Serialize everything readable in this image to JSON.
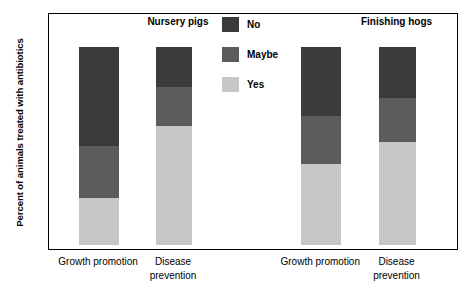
{
  "chart_data": {
    "type": "bar",
    "subtype": "stacked-bar-100",
    "title": "",
    "xlabel": "",
    "ylabel": "Percent of animals treated with antibiotics",
    "ylim": [
      0,
      100
    ],
    "yticks": [
      0,
      20,
      40,
      60,
      80,
      100
    ],
    "ytick_labels": [
      "0",
      "20",
      "40",
      "60",
      "80",
      "100"
    ],
    "grid": false,
    "legend_position": "upper center",
    "legend": [
      {
        "name": "No",
        "color": "#3b3b3b"
      },
      {
        "name": "Maybe",
        "color": "#5c5c5c"
      },
      {
        "name": "Yes",
        "color": "#c6c6c6"
      }
    ],
    "groups": [
      {
        "name": "Nursery pigs",
        "center_pct": 31.7
      },
      {
        "name": "Finishing hogs",
        "center_pct": 85.0
      }
    ],
    "categories": [
      "Growth promotion",
      "Disease\nprevention",
      "Growth promotion",
      "Disease\nprevention"
    ],
    "bars": [
      {
        "group": "Nursery pigs",
        "category": "Growth promotion",
        "x_left_pct": 7.3,
        "width_pct": 9.8,
        "label_center_pct": 12.2,
        "segments": [
          {
            "name": "Yes",
            "value": 23.5,
            "from": 0,
            "to": 23.5,
            "color": "#c6c6c6"
          },
          {
            "name": "Maybe",
            "value": 26.5,
            "from": 23.5,
            "to": 50.0,
            "color": "#5c5c5c"
          },
          {
            "name": "No",
            "value": 50.0,
            "from": 50.0,
            "to": 100.0,
            "color": "#3b3b3b"
          }
        ]
      },
      {
        "group": "Nursery pigs",
        "category": "Disease\nprevention",
        "x_left_pct": 26.1,
        "width_pct": 8.8,
        "label_center_pct": 30.5,
        "segments": [
          {
            "name": "Yes",
            "value": 60.0,
            "from": 0,
            "to": 60.0,
            "color": "#c6c6c6"
          },
          {
            "name": "Maybe",
            "value": 20.0,
            "from": 60.0,
            "to": 80.0,
            "color": "#5c5c5c"
          },
          {
            "name": "No",
            "value": 20.0,
            "from": 80.0,
            "to": 100.0,
            "color": "#3b3b3b"
          }
        ]
      },
      {
        "group": "Finishing hogs",
        "category": "Growth promotion",
        "x_left_pct": 61.5,
        "width_pct": 9.8,
        "label_center_pct": 66.4,
        "segments": [
          {
            "name": "Yes",
            "value": 41.0,
            "from": 0,
            "to": 41.0,
            "color": "#c6c6c6"
          },
          {
            "name": "Maybe",
            "value": 24.0,
            "from": 41.0,
            "to": 65.0,
            "color": "#5c5c5c"
          },
          {
            "name": "No",
            "value": 35.0,
            "from": 65.0,
            "to": 100.0,
            "color": "#3b3b3b"
          }
        ]
      },
      {
        "group": "Finishing hogs",
        "category": "Disease\nprevention",
        "x_left_pct": 80.5,
        "width_pct": 9.0,
        "label_center_pct": 85.0,
        "segments": [
          {
            "name": "Yes",
            "value": 52.0,
            "from": 0,
            "to": 52.0,
            "color": "#c6c6c6"
          },
          {
            "name": "Maybe",
            "value": 22.0,
            "from": 52.0,
            "to": 74.0,
            "color": "#5c5c5c"
          },
          {
            "name": "No",
            "value": 26.0,
            "from": 74.0,
            "to": 100.0,
            "color": "#3b3b3b"
          }
        ]
      }
    ]
  }
}
